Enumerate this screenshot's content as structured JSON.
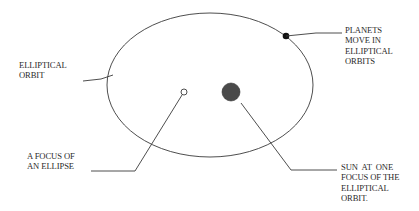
{
  "diagram": {
    "type": "keplers-first-law",
    "colors": {
      "background": "#ffffff",
      "line": "#3a3a3a",
      "text": "#2a2a2a",
      "sun": "#4a4a4a",
      "planet": "#111111"
    },
    "orbit": {
      "cx": 210,
      "cy": 85,
      "rx": 103,
      "ry": 72
    },
    "focus": {
      "cx": 184,
      "cy": 92,
      "r": 3
    },
    "sun": {
      "cx": 231,
      "cy": 92,
      "r": 9
    },
    "planet": {
      "cx": 286,
      "cy": 36,
      "r": 3.3
    },
    "labels": {
      "orbit": "ELLIPTICAL\nORBIT",
      "planets": "PLANETS\nMOVE IN\nELLIPTICAL\nORBITS",
      "focus": "A FOCUS OF\nAN ELLIPSE",
      "sun": "SUN  AT  ONE\nFOCUS OF THE\nELLIPTICAL\nORBIT."
    },
    "leaders": {
      "orbit": "83,81 101,79 113,75",
      "planets": "286,36 316,33 342,33",
      "focus": "91,171 135,171 182,95",
      "sun": "241,103 291,170 337,170"
    }
  }
}
